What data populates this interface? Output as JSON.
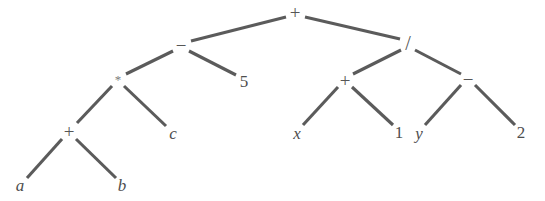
{
  "figure": {
    "kind": "expression-tree",
    "background_color": "#ffffff",
    "edge_color": "#5b5b5b",
    "label_color": "#4e4e4e",
    "width": 545,
    "height": 201
  },
  "nodes": [
    {
      "id": "root-plus",
      "label": "+",
      "kind": "operator",
      "x": 295,
      "y": 12,
      "style": "op"
    },
    {
      "id": "minus-left",
      "label": "−",
      "kind": "operator",
      "x": 181,
      "y": 45,
      "style": "op"
    },
    {
      "id": "slash",
      "label": "/",
      "kind": "operator",
      "x": 408,
      "y": 43,
      "style": "op-slash"
    },
    {
      "id": "star",
      "label": "*",
      "kind": "operator",
      "x": 118,
      "y": 79,
      "style": "op-star"
    },
    {
      "id": "five",
      "label": "5",
      "kind": "number",
      "x": 244,
      "y": 81,
      "style": "num"
    },
    {
      "id": "plus-right",
      "label": "+",
      "kind": "operator",
      "x": 345,
      "y": 80,
      "style": "op"
    },
    {
      "id": "minus-right",
      "label": "−",
      "kind": "operator",
      "x": 468,
      "y": 79,
      "style": "op"
    },
    {
      "id": "plus-left",
      "label": "+",
      "kind": "operator",
      "x": 69,
      "y": 131,
      "style": "op"
    },
    {
      "id": "var-c",
      "label": "c",
      "kind": "variable",
      "x": 173,
      "y": 133,
      "style": "var"
    },
    {
      "id": "var-x",
      "label": "x",
      "kind": "variable",
      "x": 297,
      "y": 133,
      "style": "var"
    },
    {
      "id": "one",
      "label": "1",
      "kind": "number",
      "x": 399,
      "y": 132,
      "style": "num"
    },
    {
      "id": "var-y",
      "label": "y",
      "kind": "variable",
      "x": 419,
      "y": 133,
      "style": "var"
    },
    {
      "id": "two",
      "label": "2",
      "kind": "number",
      "x": 521,
      "y": 132,
      "style": "num"
    },
    {
      "id": "var-a",
      "label": "a",
      "kind": "variable",
      "x": 20,
      "y": 185,
      "style": "var"
    },
    {
      "id": "var-b",
      "label": "b",
      "kind": "variable",
      "x": 122,
      "y": 185,
      "style": "var"
    }
  ],
  "edges": [
    {
      "id": "edge-root-minusleft",
      "from": "root-plus",
      "to": "minus-left",
      "x1": 286,
      "y1": 17,
      "x2": 191,
      "y2": 41
    },
    {
      "id": "edge-root-slash",
      "from": "root-plus",
      "to": "slash",
      "x1": 305,
      "y1": 17,
      "x2": 400,
      "y2": 39
    },
    {
      "id": "edge-minusleft-star",
      "from": "minus-left",
      "to": "star",
      "x1": 173,
      "y1": 51,
      "x2": 126,
      "y2": 74
    },
    {
      "id": "edge-minusleft-five",
      "from": "minus-left",
      "to": "five",
      "x1": 189,
      "y1": 51,
      "x2": 236,
      "y2": 75
    },
    {
      "id": "edge-star-plusleft",
      "from": "star",
      "to": "plus-left",
      "x1": 112,
      "y1": 86,
      "x2": 77,
      "y2": 123
    },
    {
      "id": "edge-star-varc",
      "from": "star",
      "to": "var-c",
      "x1": 124,
      "y1": 86,
      "x2": 166,
      "y2": 126
    },
    {
      "id": "edge-plusleft-vara",
      "from": "plus-left",
      "to": "var-a",
      "x1": 62,
      "y1": 139,
      "x2": 27,
      "y2": 178
    },
    {
      "id": "edge-plusleft-varb",
      "from": "plus-left",
      "to": "var-b",
      "x1": 76,
      "y1": 139,
      "x2": 116,
      "y2": 178
    },
    {
      "id": "edge-slash-plusright",
      "from": "slash",
      "to": "plus-right",
      "x1": 401,
      "y1": 50,
      "x2": 353,
      "y2": 74
    },
    {
      "id": "edge-slash-minusright",
      "from": "slash",
      "to": "minus-right",
      "x1": 415,
      "y1": 50,
      "x2": 461,
      "y2": 74
    },
    {
      "id": "edge-plusright-varx",
      "from": "plus-right",
      "to": "var-x",
      "x1": 338,
      "y1": 87,
      "x2": 303,
      "y2": 125
    },
    {
      "id": "edge-plusright-one",
      "from": "plus-right",
      "to": "one",
      "x1": 352,
      "y1": 87,
      "x2": 393,
      "y2": 125
    },
    {
      "id": "edge-minusright-vary",
      "from": "minus-right",
      "to": "var-y",
      "x1": 461,
      "y1": 85,
      "x2": 425,
      "y2": 125
    },
    {
      "id": "edge-minusright-two",
      "from": "minus-right",
      "to": "two",
      "x1": 475,
      "y1": 85,
      "x2": 515,
      "y2": 125
    }
  ]
}
